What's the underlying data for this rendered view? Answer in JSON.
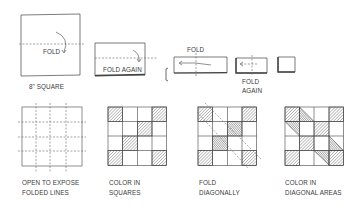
{
  "diagram": {
    "top_row": {
      "step1": {
        "label": "FOLD",
        "caption": "8\" SQUARE"
      },
      "step2": {
        "label": "FOLD AGAIN"
      },
      "step3": {
        "label": "FOLD"
      },
      "step4": {
        "label_line1": "FOLD",
        "label_line2": "AGAIN"
      }
    },
    "bottom_row": [
      {
        "line1": "OPEN TO EXPOSE",
        "line2": "FOLDED LINES"
      },
      {
        "line1": "COLOR IN",
        "line2": "SQUARES"
      },
      {
        "line1": "FOLD",
        "line2": "DIAGONALLY"
      },
      {
        "line1": "COLOR IN",
        "line2": "DIAGONAL AREAS"
      }
    ],
    "grid": {
      "rows": 4,
      "cols": 4,
      "colored_squares": [
        [
          0,
          0
        ],
        [
          0,
          3
        ],
        [
          1,
          2
        ],
        [
          2,
          1
        ],
        [
          3,
          0
        ],
        [
          3,
          3
        ]
      ]
    },
    "colors": {
      "line": "#3a3a3a",
      "hatch": "#555555",
      "dash": "#666666"
    }
  }
}
